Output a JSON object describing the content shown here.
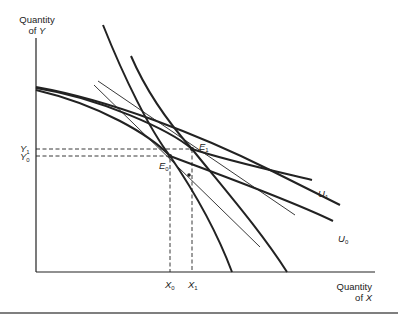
{
  "diagram": {
    "y_axis_title_line1": "Quantity",
    "y_axis_title_line2_prefix": "of ",
    "y_axis_title_var": "Y",
    "x_axis_title_line1": "Quantity",
    "x_axis_title_line2_prefix": "of ",
    "x_axis_title_var": "X",
    "ticks": {
      "y1": {
        "var": "Y",
        "sub": "1"
      },
      "y0": {
        "var": "Y",
        "sub": "0"
      },
      "x0": {
        "var": "X",
        "sub": "0"
      },
      "x1": {
        "var": "X",
        "sub": "1"
      }
    },
    "points": {
      "e1": {
        "var": "E",
        "sub": "1"
      },
      "e0": {
        "var": "E",
        "sub": "0"
      }
    },
    "curves": {
      "u1": {
        "var": "U",
        "sub": "1"
      },
      "u0": {
        "var": "U",
        "sub": "0"
      }
    },
    "colors": {
      "ink": "#222222",
      "rule": "#555555"
    }
  }
}
